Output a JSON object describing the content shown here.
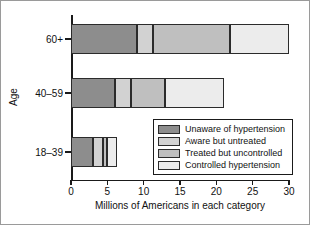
{
  "chart_data": {
    "type": "bar",
    "orientation": "horizontal",
    "stacked": true,
    "title": "",
    "xlabel": "Millions of Americans in each category",
    "ylabel": "Age",
    "categories": [
      "60+",
      "40–59",
      "18–39"
    ],
    "xlim": [
      0,
      30
    ],
    "xticks": [
      0,
      5,
      10,
      15,
      20,
      25,
      30
    ],
    "xticklabels": [
      "0",
      "5",
      "10",
      "15",
      "20",
      "25",
      "30"
    ],
    "grid": false,
    "legend_position": "inside-lower-right",
    "series": [
      {
        "name": "Unaware of hypertension",
        "color": "#8d8d8d",
        "values": [
          9.1,
          6.0,
          3.0
        ]
      },
      {
        "name": "Aware but untreated",
        "color": "#d2d2d2",
        "values": [
          2.2,
          2.3,
          1.4
        ]
      },
      {
        "name": "Treated but uncontrolled",
        "color": "#bfbfbf",
        "values": [
          10.6,
          4.6,
          0.5
        ]
      },
      {
        "name": "Controlled hypertension",
        "color": "#ececec",
        "values": [
          8.1,
          8.2,
          1.4
        ]
      }
    ],
    "totals": [
      30.0,
      21.1,
      6.3
    ]
  },
  "axis": {
    "x_title": "Millions of Americans in each category",
    "y_title": "Age"
  },
  "legend": {
    "entries": [
      {
        "label": "Unaware of hypertension",
        "color": "#8d8d8d"
      },
      {
        "label": "Aware but untreated",
        "color": "#d2d2d2"
      },
      {
        "label": "Treated but uncontrolled",
        "color": "#bfbfbf"
      },
      {
        "label": "Controlled hypertension",
        "color": "#ececec"
      }
    ]
  }
}
